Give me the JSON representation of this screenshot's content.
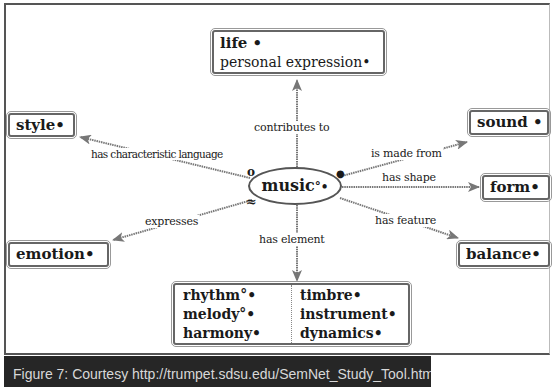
{
  "diagram": {
    "central_node": {
      "label": "music",
      "marker": "°•"
    },
    "nodes": {
      "life": {
        "lines": [
          "life •",
          "personal expression•"
        ]
      },
      "style": {
        "label": "style•"
      },
      "sound": {
        "label": "sound •"
      },
      "form": {
        "label": "form•"
      },
      "emotion": {
        "label": "emotion•"
      },
      "balance": {
        "label": "balance•"
      },
      "elements": {
        "left": [
          "rhythm°•",
          "melody°•",
          "harmony•"
        ],
        "right": [
          "timbre•",
          "instrument•",
          "dynamics•"
        ]
      }
    },
    "edges": [
      {
        "label": "contributes to",
        "to": "life"
      },
      {
        "label": "has characteristic language",
        "to": "style"
      },
      {
        "label": "is made from",
        "to": "sound"
      },
      {
        "label": "has shape",
        "to": "form"
      },
      {
        "label": "expresses",
        "to": "emotion"
      },
      {
        "label": "has feature",
        "to": "balance"
      },
      {
        "label": "has element",
        "to": "elements"
      }
    ],
    "symbols": {
      "open_circle": "o",
      "filled_circle": "●",
      "wave": "≈"
    }
  },
  "caption": "Figure 7: Courtesy http://trumpet.sdsu.edu/SemNet_Study_Tool.html"
}
